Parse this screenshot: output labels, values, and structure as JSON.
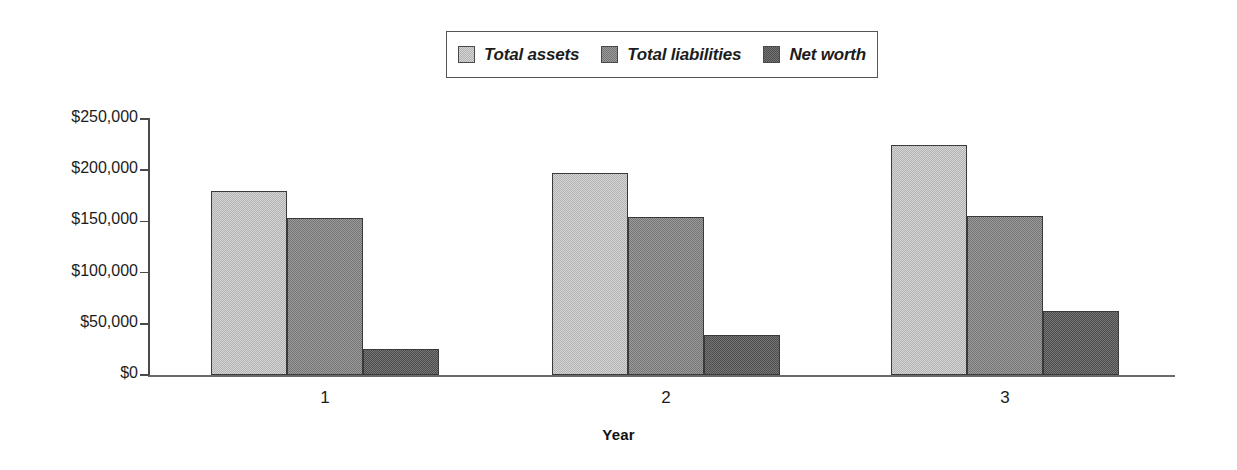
{
  "chart_data": {
    "type": "bar",
    "title": "",
    "subtitle": "",
    "xlabel": "Year",
    "ylabel": "",
    "categories": [
      "1",
      "2",
      "3"
    ],
    "series": [
      {
        "name": "Total assets",
        "color": "#d4d4d4",
        "values": [
          180000,
          197000,
          225000
        ]
      },
      {
        "name": "Total liabilities",
        "color": "#9a9a9a",
        "values": [
          153000,
          154000,
          155000
        ]
      },
      {
        "name": "Net worth",
        "color": "#757575",
        "values": [
          25000,
          39000,
          63000
        ]
      }
    ],
    "ylim": [
      0,
      250000
    ],
    "ytick_values": [
      0,
      50000,
      100000,
      150000,
      200000,
      250000
    ],
    "ytick_labels": [
      "$0",
      "$50,000",
      "$100,000",
      "$150,000",
      "$200,000",
      "$250,000"
    ],
    "grid": false,
    "legend_position": "top-center",
    "orientation": "vertical",
    "grouped": true,
    "annotations": []
  },
  "legend": {
    "entries": [
      {
        "label": "Total assets"
      },
      {
        "label": "Total liabilities"
      },
      {
        "label": "Net worth"
      }
    ]
  },
  "axis": {
    "x_title": "Year"
  }
}
